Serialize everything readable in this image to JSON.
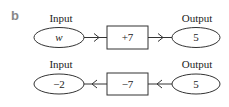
{
  "panel_label": "b",
  "rows": [
    {
      "direction": "forward",
      "input_label": "Input",
      "input_value": "w",
      "operation": "+7",
      "output_label": "Output",
      "output_value": "5"
    },
    {
      "direction": "reverse",
      "input_label": "Input",
      "input_value": "−2",
      "operation": "−7",
      "output_label": "Output",
      "output_value": "5"
    }
  ],
  "colors": {
    "stroke": "#333333",
    "text": "#222222",
    "panel_label": "#888888"
  }
}
